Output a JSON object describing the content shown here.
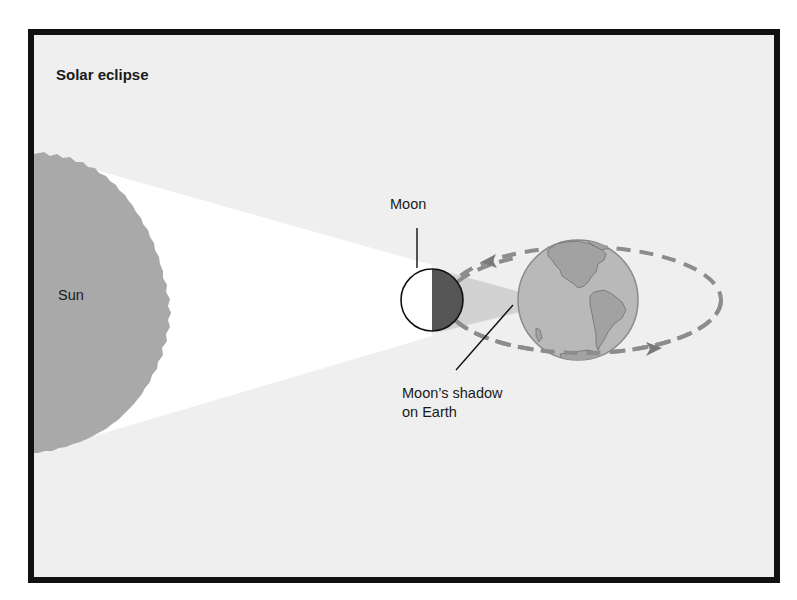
{
  "diagram": {
    "title": "Solar eclipse",
    "labels": {
      "sun": "Sun",
      "moon": "Moon",
      "shadow_line1": "Moon’s shadow",
      "shadow_line2": "on Earth"
    },
    "colors": {
      "frame": "#111111",
      "background": "#efefef",
      "sun": "#a9a9a9",
      "light_cone": "#ffffff",
      "moon_lit": "#ffffff",
      "moon_dark": "#555555",
      "shadow_cone": "#d2d2d2",
      "earth_ocean": "#b9b9b9",
      "earth_land": "#a2a2a2",
      "orbit": "#8c8c8c",
      "leader": "#111111"
    }
  }
}
